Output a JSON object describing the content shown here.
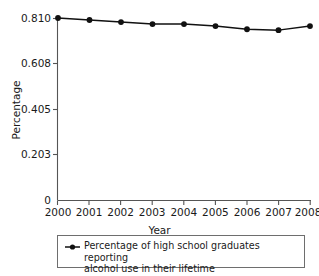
{
  "chart_data": {
    "type": "line",
    "title": "",
    "subtitle": "",
    "xlabel": "Year",
    "ylabel": "Percentage",
    "categories": [
      "2000",
      "2001",
      "2002",
      "2003",
      "2004",
      "2005",
      "2006",
      "2007",
      "2008"
    ],
    "x": [
      2000,
      2001,
      2002,
      2003,
      2004,
      2005,
      2006,
      2007,
      2008
    ],
    "values": [
      0.81,
      0.801,
      0.792,
      0.783,
      0.783,
      0.774,
      0.76,
      0.756,
      0.774
    ],
    "series": [
      {
        "name": "Percentage of high school graduates reporting alcohol use in their lifetime",
        "values": [
          0.81,
          0.801,
          0.792,
          0.783,
          0.783,
          0.774,
          0.76,
          0.756,
          0.774
        ]
      }
    ],
    "xlim": [
      2000,
      2008
    ],
    "ylim": [
      0,
      0.81
    ],
    "ytick_labels": [
      "0",
      "0.203",
      "0.405",
      "0.608",
      "0.810"
    ],
    "ytick_values": [
      0,
      0.203,
      0.405,
      0.608,
      0.81
    ],
    "xtick_labels": [
      "2000",
      "2001",
      "2002",
      "2003",
      "2004",
      "2005",
      "2006",
      "2007",
      "2008"
    ],
    "grid": false,
    "legend_position": "bottom",
    "legend_entries": [
      "Percentage of high school graduates reporting alcohol use in their lifetime"
    ],
    "marker": "filled-circle",
    "line_color": "#111111",
    "annotations": []
  },
  "axes": {
    "ylabel": "Percentage",
    "xlabel": "Year",
    "yticks": [
      {
        "label": "0.810",
        "value": 0.81
      },
      {
        "label": "0.608",
        "value": 0.608
      },
      {
        "label": "0.405",
        "value": 0.405
      },
      {
        "label": "0.203",
        "value": 0.203
      },
      {
        "label": "0",
        "value": 0
      }
    ],
    "xticks": [
      {
        "label": "2000",
        "value": 2000
      },
      {
        "label": "2001",
        "value": 2001
      },
      {
        "label": "2002",
        "value": 2002
      },
      {
        "label": "2003",
        "value": 2003
      },
      {
        "label": "2004",
        "value": 2004
      },
      {
        "label": "2005",
        "value": 2005
      },
      {
        "label": "2006",
        "value": 2006
      },
      {
        "label": "2007",
        "value": 2007
      },
      {
        "label": "2008",
        "value": 2008
      }
    ]
  },
  "legend": {
    "marker_name": "line-circle-marker",
    "label": "Percentage of high school graduates reporting\nalcohol use in their lifetime"
  },
  "colors": {
    "line": "#111111",
    "marker": "#111111",
    "axis": "#555555",
    "text": "#1a1a1a",
    "legend_border": "#6e6e6e",
    "background": "#ffffff"
  }
}
